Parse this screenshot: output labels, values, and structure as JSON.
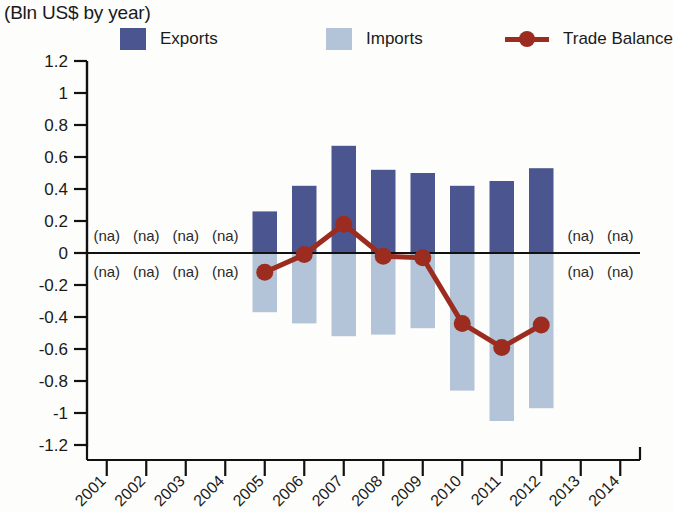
{
  "title_partial": "Exports, Imports and Trade Balance by year",
  "subtitle": "(Bln US$ by year)",
  "colors": {
    "exports": "#4b5691",
    "imports": "#b3c3d8",
    "trade_balance": "#9b2c1f",
    "axis": "#111111",
    "text": "#1a1a1a"
  },
  "legend": {
    "position": "top",
    "items": [
      {
        "label": "Exports",
        "marker": "square-swatch",
        "color": "#4b5691"
      },
      {
        "label": "Imports",
        "marker": "square-swatch",
        "color": "#b3c3d8"
      },
      {
        "label": "Trade Balance",
        "marker": "line-with-circle",
        "color": "#9b2c1f"
      }
    ]
  },
  "na_text": "(na)",
  "chart_data": {
    "type": "bar",
    "title": "Exports, Imports and Trade Balance by year",
    "subtitle": "(Bln US$ by year)",
    "xlabel": "",
    "ylabel": "Bln US$",
    "ylim": [
      -1.2,
      1.2
    ],
    "ytick_step": 0.2,
    "yticks": [
      1.2,
      1,
      0.8,
      0.6,
      0.4,
      0.2,
      0,
      -0.2,
      -0.4,
      -0.6,
      -0.8,
      -1,
      -1.2
    ],
    "ytick_labels": [
      "1.2",
      "1",
      "0.8",
      "0.6",
      "0.4",
      "0.2",
      "0",
      "-0.2",
      "-0.4",
      "-0.6",
      "-0.8",
      "-1",
      "-1.2"
    ],
    "grid": false,
    "categories": [
      "2001",
      "2002",
      "2003",
      "2004",
      "2005",
      "2006",
      "2007",
      "2008",
      "2009",
      "2010",
      "2011",
      "2012",
      "2013",
      "2014"
    ],
    "na_categories": [
      "2001",
      "2002",
      "2003",
      "2004",
      "2013",
      "2014"
    ],
    "series": [
      {
        "name": "Exports",
        "type": "bar",
        "color": "#4b5691",
        "values": [
          null,
          null,
          null,
          null,
          0.26,
          0.42,
          0.67,
          0.52,
          0.5,
          0.42,
          0.45,
          0.53,
          null,
          null
        ]
      },
      {
        "name": "Imports",
        "type": "bar",
        "color": "#b3c3d8",
        "values": [
          null,
          null,
          null,
          null,
          -0.37,
          -0.44,
          -0.52,
          -0.51,
          -0.47,
          -0.86,
          -1.05,
          -0.97,
          null,
          null
        ]
      },
      {
        "name": "Trade Balance",
        "type": "line",
        "color": "#9b2c1f",
        "values": [
          null,
          null,
          null,
          null,
          -0.12,
          -0.01,
          0.18,
          -0.02,
          -0.03,
          -0.44,
          -0.59,
          -0.45,
          null,
          null
        ]
      }
    ]
  }
}
